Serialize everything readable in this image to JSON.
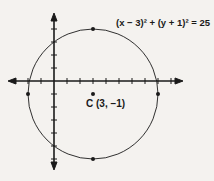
{
  "chart_data": {
    "type": "scatter",
    "title": "",
    "equation": "(x − 3)² + (y + 1)² = 25",
    "center_label": "C (3, −1)",
    "center": {
      "x": 3,
      "y": -1
    },
    "radius": 5,
    "points": [
      {
        "x": 3,
        "y": 4
      },
      {
        "x": 3,
        "y": -6
      },
      {
        "x": -2,
        "y": -1
      },
      {
        "x": 8,
        "y": -1
      },
      {
        "x": 3,
        "y": -1
      }
    ],
    "xlim": [
      -10,
      10
    ],
    "ylim": [
      -7,
      5
    ],
    "xlabel": "",
    "ylabel": "",
    "grid": false,
    "tick_spacing": 1
  },
  "labels": {
    "equation": "(x − 3)² + (y + 1)² = 25",
    "center": "C (3, −1)"
  },
  "colors": {
    "ink": "#1a1a1a",
    "paper": "#f4f2ef"
  }
}
